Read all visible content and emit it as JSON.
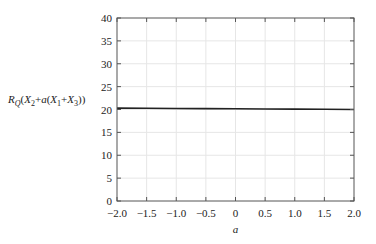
{
  "chart_data": {
    "type": "line",
    "title": "",
    "xlabel": "a",
    "ylabel": "R_Q(X_2+a(X_1+X_3))",
    "xlim": [
      -2.0,
      2.0
    ],
    "ylim": [
      0,
      40
    ],
    "x_ticks": [
      "−2.0",
      "−1.5",
      "−1.0",
      "−0.5",
      "0",
      "0.5",
      "1.0",
      "1.5",
      "2.0"
    ],
    "y_ticks": [
      "0",
      "5",
      "10",
      "15",
      "20",
      "25",
      "30",
      "35",
      "40"
    ],
    "grid": true,
    "legend": null,
    "series": [
      {
        "name": "R_Q(X_2+a(X_1+X_3))",
        "color": "#222222",
        "x": [
          -2.0,
          -1.5,
          -1.0,
          -0.5,
          0,
          0.5,
          1.0,
          1.5,
          2.0
        ],
        "y": [
          20.3,
          20.26,
          20.22,
          20.19,
          20.15,
          20.11,
          20.08,
          20.04,
          20.0
        ]
      }
    ]
  },
  "ylabel_parts": {
    "R": "R",
    "Q": "Q",
    "open": "(",
    "X": "X",
    "s2": "2",
    "plus_a": "+",
    "a": "a",
    "open2": "(",
    "s1": "1",
    "plus": "+",
    "s3": "3",
    "close": "))"
  }
}
